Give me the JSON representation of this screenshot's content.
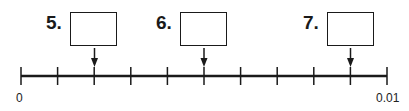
{
  "number_line": {
    "start_label": "0",
    "end_label": "0.01",
    "min": 0,
    "max": 0.01,
    "intervals": 10,
    "tick_step": 0.001
  },
  "questions": [
    {
      "label": "5.",
      "answer": "",
      "points_to_tick": 2,
      "value": 0.002
    },
    {
      "label": "6.",
      "answer": "",
      "points_to_tick": 5,
      "value": 0.005
    },
    {
      "label": "7.",
      "answer": "",
      "points_to_tick": 9,
      "value": 0.009
    }
  ],
  "colors": {
    "stroke": "#1a1a1a",
    "background": "#ffffff"
  }
}
